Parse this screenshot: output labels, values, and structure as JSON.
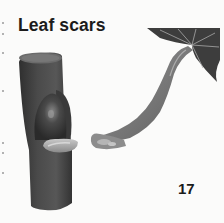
{
  "page": {
    "title": "Leaf scars",
    "page_number": "17"
  },
  "illustrations": [
    {
      "name": "twig-with-bud-and-leaf-scar",
      "description": "Cut twig section with a bud above a crescent-shaped leaf scar"
    },
    {
      "name": "detached-leaf-petiole",
      "description": "Leaf with long curving petiole whose base shows the matching leaf scar surface"
    }
  ],
  "colors": {
    "background": "#fbfbfa",
    "text": "#1b1b1b",
    "stem_dark": "#3a3a3a",
    "stem_mid": "#555555",
    "scar_light": "#b8b8b8",
    "leaf_dark": "#3d3d3d"
  }
}
